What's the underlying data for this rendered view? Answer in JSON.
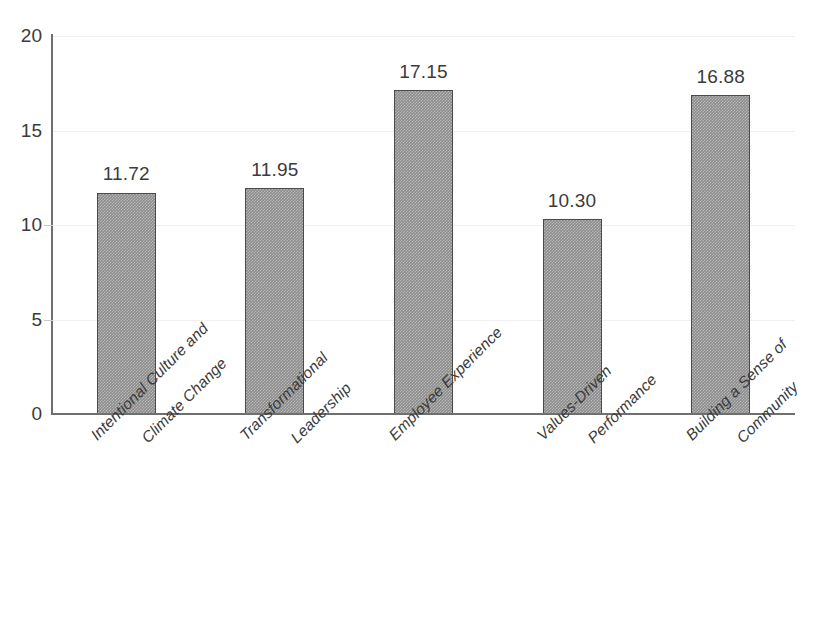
{
  "chart_data": {
    "type": "bar",
    "title": "",
    "subtitle": "",
    "xlabel": "",
    "ylabel": "",
    "ylim": [
      0,
      20
    ],
    "y_ticks": [
      0,
      5,
      10,
      15,
      20
    ],
    "grid": true,
    "legend": "none",
    "orientation": "vertical",
    "bar_color": "#8c8c8c",
    "bar_edge_color": "#4a4a4a",
    "text_color": "#3b3b3b",
    "axis_color": "#6f6f6f",
    "gridline_color": "#f1f0ee",
    "categories": [
      "Intentional Culture and Climate Change",
      "Transformational Leadership",
      "Employee Experience",
      "Values-Driven Performance",
      "Building a Sense of Community"
    ],
    "category_lines": [
      [
        "Intentional Culture and",
        "Climate Change"
      ],
      [
        "Transformational",
        "Leadership"
      ],
      [
        "Employee Experience",
        ""
      ],
      [
        "Values-Driven",
        "Performance"
      ],
      [
        "Building a Sense of",
        "Community"
      ]
    ],
    "values": [
      11.72,
      11.95,
      17.15,
      10.3,
      16.88
    ],
    "value_labels": [
      "11.72",
      "11.95",
      "17.15",
      "10.30",
      "16.88"
    ]
  },
  "axis": {
    "y_tick_labels": [
      "20",
      "15",
      "10",
      "5",
      "0"
    ]
  }
}
